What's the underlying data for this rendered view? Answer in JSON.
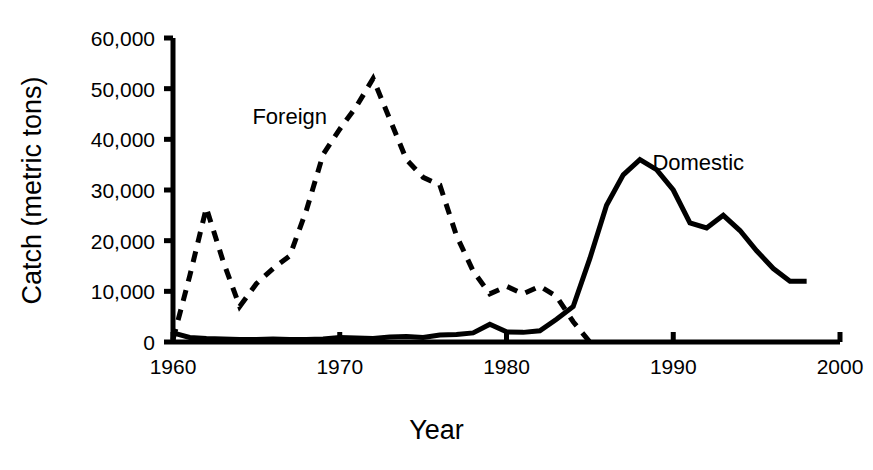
{
  "chart_data": {
    "type": "line",
    "title": "",
    "xlabel": "Year",
    "ylabel": "Catch (metric tons)",
    "xlim": [
      1960,
      2000
    ],
    "ylim": [
      0,
      60000
    ],
    "xticks": [
      1960,
      1970,
      1980,
      1990,
      2000
    ],
    "xtick_labels": [
      "1960",
      "1970",
      "1980",
      "1990",
      "2000"
    ],
    "yticks": [
      0,
      10000,
      20000,
      30000,
      40000,
      50000,
      60000
    ],
    "ytick_labels": [
      "0",
      "10,000",
      "20,000",
      "30,000",
      "40,000",
      "50,000",
      "60,000"
    ],
    "grid": false,
    "legend_position": "inline-annotation",
    "series": [
      {
        "name": "Foreign",
        "style": "dashed",
        "color": "#000000",
        "x": [
          1960,
          1961,
          1962,
          1963,
          1964,
          1965,
          1966,
          1967,
          1968,
          1969,
          1970,
          1971,
          1972,
          1973,
          1974,
          1975,
          1976,
          1977,
          1978,
          1979,
          1980,
          1981,
          1982,
          1983,
          1984,
          1985
        ],
        "values": [
          500,
          13000,
          26500,
          16000,
          7000,
          11500,
          14500,
          17000,
          26000,
          37000,
          42000,
          46500,
          52000,
          44000,
          36000,
          32500,
          31000,
          21000,
          14000,
          9500,
          11000,
          9500,
          11000,
          9000,
          4000,
          0
        ]
      },
      {
        "name": "Domestic",
        "style": "solid",
        "color": "#000000",
        "x": [
          1960,
          1961,
          1962,
          1963,
          1964,
          1965,
          1966,
          1967,
          1968,
          1969,
          1970,
          1971,
          1972,
          1973,
          1974,
          1975,
          1976,
          1977,
          1978,
          1979,
          1980,
          1981,
          1982,
          1983,
          1984,
          1985,
          1986,
          1987,
          1988,
          1989,
          1990,
          1991,
          1992,
          1993,
          1994,
          1995,
          1996,
          1997,
          1998
        ],
        "values": [
          1800,
          900,
          700,
          600,
          500,
          500,
          600,
          500,
          500,
          600,
          900,
          800,
          700,
          1000,
          1100,
          900,
          1400,
          1500,
          1800,
          3500,
          2000,
          1900,
          2200,
          4500,
          7000,
          16500,
          27000,
          33000,
          36000,
          34000,
          30000,
          23500,
          22500,
          25000,
          22000,
          18000,
          14500,
          12000,
          12000
        ]
      }
    ],
    "annotations": [
      {
        "text": "Foreign",
        "x": 1967.0,
        "y": 43000
      },
      {
        "text": "Domestic",
        "x": 1991.5,
        "y": 34000
      }
    ]
  }
}
